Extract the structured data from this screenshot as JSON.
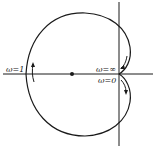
{
  "diagram": {
    "type": "nyquist-plot",
    "labels": {
      "omega_one": "ω=1",
      "omega_inf": "ω=∞",
      "omega_zero": "ω=0"
    },
    "axes": {
      "horizontal": "real-axis",
      "vertical": "imaginary-axis"
    },
    "points": {
      "critical_point": "dot on real axis"
    },
    "colors": {
      "stroke": "#1a1a1a",
      "background": "#ffffff"
    }
  }
}
